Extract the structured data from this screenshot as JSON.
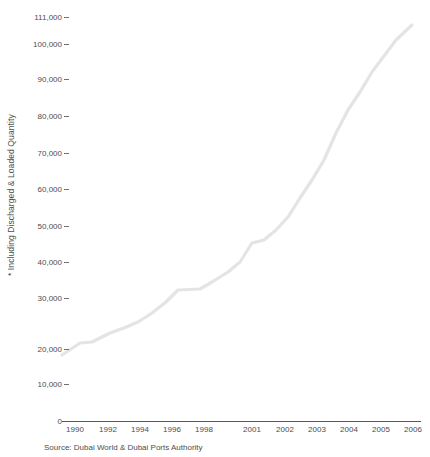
{
  "chart_data": {
    "type": "line",
    "title": "",
    "xlabel": "",
    "ylabel": "* Including Discharged & Loaded Quantity",
    "source": "Source: Dubai World & Dubai Ports Authority",
    "grid": false,
    "legend": "none",
    "line_color": "#e4e4e4",
    "axis_color": "#595959",
    "text_color": "#4d4d4d",
    "ylim": [
      0,
      111000
    ],
    "ytick_labels": [
      "111,000",
      "100,000",
      "90,000",
      "80,000",
      "70,000",
      "60,000",
      "50,000",
      "40,000",
      "30,000",
      "20,000",
      "10,000",
      "0"
    ],
    "ytick_values": [
      111000,
      100000,
      90000,
      80000,
      70000,
      60000,
      50000,
      40000,
      30000,
      20000,
      10000,
      0
    ],
    "xtick_labels": [
      "1990",
      "1992",
      "1994",
      "1996",
      "1998",
      "2001",
      "2002",
      "2003",
      "2004",
      "2005",
      "2006"
    ],
    "categories": [
      "1990",
      "1991",
      "1992",
      "1993",
      "1994",
      "1995",
      "1996",
      "1997",
      "1998",
      "1999",
      "2000",
      "2001",
      "2002",
      "2003",
      "2004",
      "2005",
      "2006"
    ],
    "values": [
      18100,
      21400,
      21700,
      24100,
      26000,
      27600,
      30300,
      33400,
      33700,
      36400,
      41000,
      44000,
      45800,
      49800,
      55600,
      62000,
      74000
    ],
    "series": [
      {
        "name": "Total Cargo Quantity",
        "points": [
          {
            "x": "1990",
            "y": 18100
          },
          {
            "x": "1991",
            "y": 21400
          },
          {
            "x": "1992",
            "y": 21700
          },
          {
            "x": "1993",
            "y": 24100
          },
          {
            "x": "1994",
            "y": 26000
          },
          {
            "x": "1995",
            "y": 27600
          },
          {
            "x": "1996",
            "y": 30300
          },
          {
            "x": "1997",
            "y": 33400
          },
          {
            "x": "1998",
            "y": 33700
          },
          {
            "x": "1999",
            "y": 36400
          },
          {
            "x": "2000",
            "y": 41000
          },
          {
            "x": "2001",
            "y": 44000
          },
          {
            "x": "2002",
            "y": 45800
          },
          {
            "x": "2003",
            "y": 49800
          },
          {
            "x": "2004",
            "y": 55600
          },
          {
            "x": "2005",
            "y": 62000
          },
          {
            "x": "2006",
            "y": 74000
          },
          {
            "x": "2007",
            "y": 84000
          },
          {
            "x": "2008",
            "y": 93000
          },
          {
            "x": "2009",
            "y": 101000
          },
          {
            "x": "2010",
            "y": 108800
          }
        ]
      }
    ]
  },
  "yticks": [
    {
      "label": "111,000",
      "top": 13
    },
    {
      "label": "100,000",
      "top": 40
    },
    {
      "label": "90,000",
      "top": 75
    },
    {
      "label": "80,000",
      "top": 112
    },
    {
      "label": "70,000",
      "top": 149
    },
    {
      "label": "60,000",
      "top": 185
    },
    {
      "label": "50,000",
      "top": 222
    },
    {
      "label": "40,000",
      "top": 258
    },
    {
      "label": "30,000",
      "top": 294
    },
    {
      "label": "20,000",
      "top": 345
    },
    {
      "label": "10,000",
      "top": 380
    },
    {
      "label": "0",
      "top": 417
    }
  ],
  "xticks": [
    {
      "label": "1990",
      "left": 55
    },
    {
      "label": "1992",
      "left": 88
    },
    {
      "label": "1994",
      "left": 120
    },
    {
      "label": "1996",
      "left": 152
    },
    {
      "label": "1998",
      "left": 184
    },
    {
      "label": "2001",
      "left": 232
    },
    {
      "label": "2002",
      "left": 265
    },
    {
      "label": "2003",
      "left": 297
    },
    {
      "label": "2004",
      "left": 329
    },
    {
      "label": "2005",
      "left": 361
    },
    {
      "label": "2006",
      "left": 393
    }
  ],
  "axis_title": "* Including Discharged & Loaded Quantity",
  "source_note": "Source: Dubai World & Dubai Ports Authority",
  "line_path": "M62,355 L80,343 L92,342 L110,333 L124,328 L138,322 L152,313 L166,302 L178,290 L200,289 L212,282 L228,272 L240,262 L252,243 L264,240 L276,230 L288,217 L300,198 L312,180 L324,160 L336,133 L348,110 L360,92 L372,72 L384,56 L396,40 L412,25"
}
